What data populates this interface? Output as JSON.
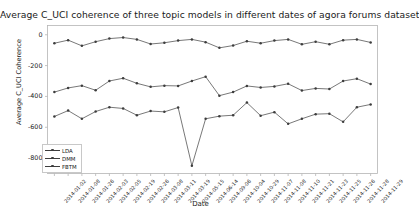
{
  "chart_data": {
    "type": "line",
    "title": "Average C_UCI coherence of three topic models in different dates of agora forums dataset",
    "xlabel": "Date",
    "ylabel": "Average C_UCI Coherence",
    "ylim": [
      -900,
      60
    ],
    "yticks": [
      0,
      -200,
      -400,
      -600,
      -800
    ],
    "ytick_labels": [
      "0",
      "-200",
      "-400",
      "-600",
      "-800"
    ],
    "grid": false,
    "legend_position": "lower left",
    "categories": [
      "2014-01-02",
      "2014-01-08",
      "2014-01-26",
      "2014-02-03",
      "2014-02-05",
      "2014-02-19",
      "2014-02-26",
      "2014-03-08",
      "2014-03-11",
      "2014-03-19",
      "2014-05-15",
      "2014-06-14",
      "2014-09-06",
      "2014-10-04",
      "2014-10-29",
      "2014-11-07",
      "2014-11-08",
      "2014-11-10",
      "2014-11-21",
      "2014-11-23",
      "2014-11-25",
      "2014-11-26",
      "2014-11-28",
      "2014-11-29"
    ],
    "x": [
      "2014-01-02",
      "2014-01-08",
      "2014-01-26",
      "2014-02-03",
      "2014-02-05",
      "2014-02-19",
      "2014-02-26",
      "2014-03-08",
      "2014-03-11",
      "2014-03-19",
      "2014-05-15",
      "2014-06-14",
      "2014-09-06",
      "2014-10-04",
      "2014-10-29",
      "2014-11-07",
      "2014-11-08",
      "2014-11-10",
      "2014-11-21",
      "2014-11-23",
      "2014-11-25",
      "2014-11-26",
      "2014-11-28",
      "2014-11-29"
    ],
    "series": [
      {
        "name": "LDA",
        "color": "#3d3d3d",
        "values": [
          -55,
          -35,
          -72,
          -45,
          -25,
          -18,
          -30,
          -60,
          -52,
          -38,
          -30,
          -48,
          -85,
          -70,
          -42,
          -55,
          -38,
          -30,
          -62,
          -45,
          -62,
          -35,
          -30,
          -50
        ]
      },
      {
        "name": "DMM",
        "color": "#3d3d3d",
        "values": [
          -372,
          -345,
          -330,
          -360,
          -300,
          -282,
          -315,
          -338,
          -330,
          -332,
          -300,
          -272,
          -395,
          -372,
          -332,
          -342,
          -335,
          -318,
          -362,
          -348,
          -352,
          -300,
          -285,
          -320
        ]
      },
      {
        "name": "FBTM",
        "color": "#3d3d3d",
        "values": [
          -530,
          -492,
          -545,
          -498,
          -470,
          -478,
          -522,
          -495,
          -500,
          -472,
          -850,
          -545,
          -528,
          -522,
          -440,
          -525,
          -502,
          -578,
          -545,
          -515,
          -512,
          -565,
          -470,
          -452
        ]
      }
    ]
  },
  "legend": {
    "items": [
      {
        "label": "LDA"
      },
      {
        "label": "DMM"
      },
      {
        "label": "FBTM"
      }
    ]
  }
}
